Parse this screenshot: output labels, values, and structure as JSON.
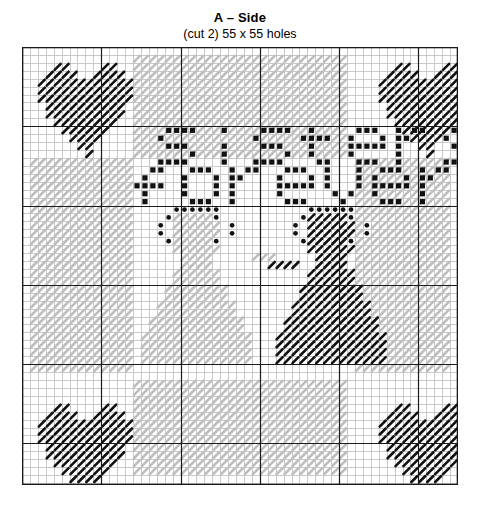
{
  "header": {
    "title": "A – Side",
    "subtitle": "(cut 2) 55 x 55 holes"
  },
  "chart": {
    "piece_label": "A",
    "piece_name": "Side",
    "cut_count": "cut 2",
    "width_holes": 55,
    "height_holes": 55,
    "cell_px": 7.92,
    "grid_origin_x": 22,
    "grid_origin_y": 47,
    "grid_line_color": "#c9c9c9",
    "heavy_line_color": "#1a1a1a",
    "heavy_line_every": 10,
    "background_color": "#ffffff",
    "stitch_colors": {
      "black": "#111111",
      "light_gray": "#bdbdbd",
      "mid_gray": "#a0a0a0",
      "white": "#ffffff"
    },
    "motifs": [
      {
        "name": "heart-top-left",
        "symbol": "black-diagonal",
        "color": "#111111"
      },
      {
        "name": "heart-top-right",
        "symbol": "black-diagonal",
        "color": "#111111"
      },
      {
        "name": "heart-bottom-left",
        "symbol": "black-diagonal",
        "color": "#111111"
      },
      {
        "name": "heart-bottom-right",
        "symbol": "black-diagonal",
        "color": "#111111"
      },
      {
        "name": "girl-left",
        "symbol": "gray-diagonal",
        "color": "#bdbdbd"
      },
      {
        "name": "girl-right",
        "symbol": "black-diagonal",
        "color": "#111111"
      },
      {
        "name": "border-band",
        "symbol": "gray-diagonal",
        "color": "#bdbdbd"
      }
    ],
    "text_lines": [
      {
        "name": "text-line-1",
        "value": "sisters are",
        "color": "#111111",
        "row": 11
      },
      {
        "name": "text-line-2",
        "value": "forever friends",
        "color": "#111111",
        "row": 16
      }
    ]
  },
  "chart_data": {
    "type": "heatmap",
    "title": "A – Side",
    "subtitle": "(cut 2) 55 x 55 holes",
    "xlabel": "",
    "ylabel": "",
    "columns": 55,
    "rows": 55,
    "legend": [
      {
        "key": "K",
        "label": "black stitch",
        "color": "#111111"
      },
      {
        "key": "G",
        "label": "light gray stitch",
        "color": "#bdbdbd"
      },
      {
        "key": "D",
        "label": "black dot / bead",
        "color": "#111111"
      },
      {
        "key": ".",
        "label": "empty hole",
        "color": "#ffffff"
      }
    ],
    "regions": {
      "border_band": {
        "description": "gray diagonal stitch band framing the chart",
        "top_rows": [
          5,
          12
        ],
        "bottom_rows": [
          43,
          50
        ],
        "left_cols": [
          5,
          12
        ],
        "right_cols": [
          43,
          50
        ],
        "outer_margin": 5,
        "color": "#bdbdbd"
      },
      "hearts": [
        {
          "name": "heart-top-left",
          "col": 2,
          "row": 2,
          "w": 12,
          "h": 12,
          "color": "#111111"
        },
        {
          "name": "heart-top-right",
          "col": 45,
          "row": 2,
          "w": 12,
          "h": 12,
          "color": "#111111"
        },
        {
          "name": "heart-bottom-left",
          "col": 2,
          "row": 45,
          "w": 12,
          "h": 12,
          "color": "#111111"
        },
        {
          "name": "heart-bottom-right",
          "col": 45,
          "row": 45,
          "w": 12,
          "h": 12,
          "color": "#111111"
        }
      ],
      "girls": [
        {
          "name": "girl-left",
          "col": 14,
          "row": 20,
          "w": 17,
          "h": 30,
          "color": "#bdbdbd",
          "bow_color": "#111111"
        },
        {
          "name": "girl-right",
          "col": 31,
          "row": 20,
          "w": 18,
          "h": 30,
          "color": "#111111",
          "bow_color": "#111111"
        }
      ]
    },
    "grid": true,
    "heavy_grid_every": 10
  }
}
